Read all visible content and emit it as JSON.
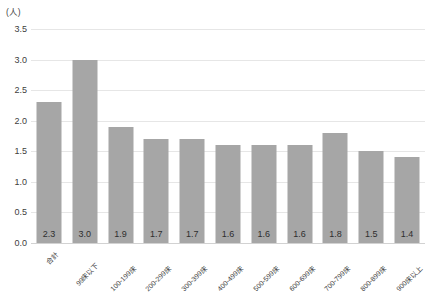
{
  "chart_data": {
    "type": "bar",
    "title": "",
    "subtitle": "",
    "xlabel": "",
    "ylabel": "(人)",
    "unit_label": "(人)",
    "categories": [
      "合計",
      "99床以下",
      "100-199床",
      "200-299床",
      "300-399床",
      "400-499床",
      "500-599床",
      "600-699床",
      "700-799床",
      "800-899床",
      "900床以上"
    ],
    "values": [
      2.3,
      3.0,
      1.9,
      1.7,
      1.7,
      1.6,
      1.6,
      1.6,
      1.8,
      1.5,
      1.4
    ],
    "data_labels": [
      "2.3",
      "3.0",
      "1.9",
      "1.7",
      "1.7",
      "1.6",
      "1.6",
      "1.6",
      "1.8",
      "1.5",
      "1.4"
    ],
    "ylim": [
      0.0,
      3.5
    ],
    "ytick_values": [
      0.0,
      0.5,
      1.0,
      1.5,
      2.0,
      2.5,
      3.0,
      3.5
    ],
    "ytick_labels": [
      "0.0",
      "0.5",
      "1.0",
      "1.5",
      "2.0",
      "2.5",
      "3.0",
      "3.5"
    ],
    "grid": true,
    "legend": false,
    "legend_position": "none",
    "bar_color": "#a6a6a6",
    "gridline_color": "#e6e6e6",
    "background_color": "#ffffff",
    "text_color": "#3a3a3a"
  }
}
